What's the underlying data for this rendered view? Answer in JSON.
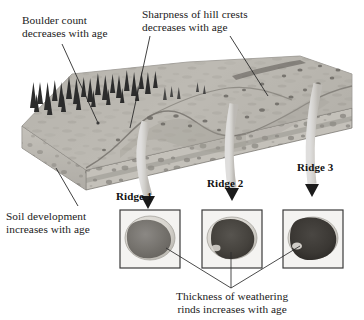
{
  "figure": {
    "type": "geomorphology-block-diagram",
    "background_color": "#ffffff",
    "annotations": {
      "boulder_count": {
        "line1": "Boulder count",
        "line2": "decreases with age"
      },
      "crest_sharpness": {
        "line1": "Sharpness of hill crests",
        "line2": "decreases with age"
      },
      "soil_development": {
        "line1": "Soil development",
        "line2": "increases with age"
      },
      "weathering_rind": {
        "line1": "Thickness of weathering",
        "line2": "rinds increases with age"
      }
    },
    "ridges": [
      {
        "label": "Ridge 1",
        "relative_age": "youngest",
        "rind_thickness": "thin-rind-widest-pale-band",
        "core_tone": "#6f6f6f"
      },
      {
        "label": "Ridge 2",
        "relative_age": "intermediate",
        "rind_thickness": "moderate",
        "core_tone": "#4a4a4a"
      },
      {
        "label": "Ridge 3",
        "relative_age": "oldest",
        "rind_thickness": "thickest-dark-core",
        "core_tone": "#3a3a3a"
      }
    ],
    "colors": {
      "ink": "#1a1a1a",
      "leader_line": "#2b2b2b",
      "box_border": "#3b3b3b",
      "terrain_light": "#c9c6c0",
      "terrain_mid": "#a7a49e",
      "terrain_dark": "#7d7a75",
      "tree_dark": "#2e2e2e",
      "arrow_band": "#f2f1ee",
      "arrow_head": "#1b1b1b"
    }
  }
}
